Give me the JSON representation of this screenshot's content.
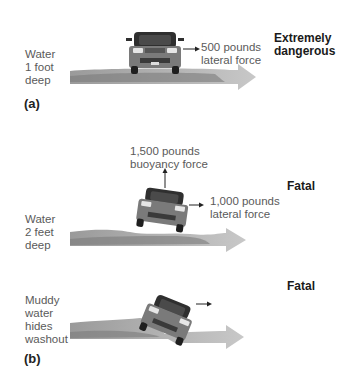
{
  "panel_a": {
    "label": "(a)",
    "water_depth": [
      "Water",
      "1 foot",
      "deep"
    ],
    "lateral_force": [
      "500 pounds",
      "lateral force"
    ],
    "verdict": [
      "Extremely",
      "dangerous"
    ]
  },
  "panel_b1": {
    "water_depth": [
      "Water",
      "2 feet",
      "deep"
    ],
    "buoyancy_force": [
      "1,500 pounds",
      "buoyancy force"
    ],
    "lateral_force": [
      "1,000 pounds",
      "lateral force"
    ],
    "verdict": "Fatal"
  },
  "panel_b2": {
    "label": "(b)",
    "description": [
      "Muddy",
      "water",
      "hides",
      "washout"
    ],
    "verdict": "Fatal"
  },
  "colors": {
    "water_light": "#bdbdbd",
    "water_dark": "#8a8a8a",
    "car_body": "#7d7d7d",
    "car_dark": "#2e2e2e"
  }
}
